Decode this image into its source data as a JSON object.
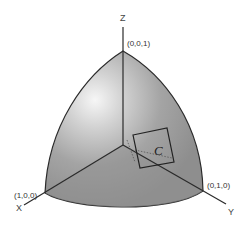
{
  "diagram": {
    "axes": {
      "x_label": "X",
      "y_label": "Y",
      "z_label": "Z"
    },
    "points": {
      "x_point": "(1,0,0)",
      "y_point": "(0,1,0)",
      "z_point": "(0,0,1)"
    },
    "curve_label": "C",
    "colors": {
      "surface": "#9a9a9a",
      "surface_highlight": "#f4f4f4",
      "lines": "#2a2a2a",
      "background": "#ffffff"
    }
  }
}
